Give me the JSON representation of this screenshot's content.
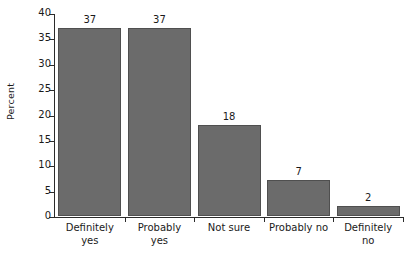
{
  "chart_data": {
    "type": "bar",
    "title": "",
    "xlabel": "",
    "ylabel": "Percent",
    "ylim": [
      0,
      40
    ],
    "ytick_values": [
      0,
      5,
      10,
      15,
      20,
      25,
      30,
      35,
      40
    ],
    "ytick_labels": [
      "0",
      "5",
      "10",
      "15",
      "20",
      "25",
      "30",
      "35",
      "40"
    ],
    "grid": false,
    "legend": null,
    "categories": [
      "Definitely yes",
      "Probably yes",
      "Not sure",
      "Probably no",
      "Definitely no"
    ],
    "category_lines": [
      [
        "Definitely",
        "yes"
      ],
      [
        "Probably",
        "yes"
      ],
      [
        "Not sure"
      ],
      [
        "Probably no"
      ],
      [
        "Definitely",
        "no"
      ]
    ],
    "values": [
      37,
      37,
      18,
      7,
      2
    ],
    "value_labels": [
      "37",
      "37",
      "18",
      "7",
      "2"
    ],
    "bar_color": "#6b6b6b",
    "bar_edge_color": "#4f4f4f",
    "axis_color": "#2b2b2b",
    "background_color": "#ffffff"
  }
}
